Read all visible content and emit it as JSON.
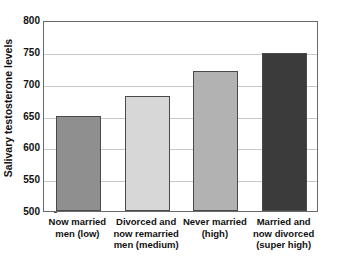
{
  "chart_data": {
    "type": "bar",
    "title": "",
    "xlabel": "",
    "ylabel": "Salivary testosterone levels",
    "ylim": [
      500,
      800
    ],
    "yticks": [
      500,
      550,
      600,
      650,
      700,
      750,
      800
    ],
    "ytick_labels": [
      "500",
      "550",
      "600",
      "650",
      "700",
      "750",
      "800"
    ],
    "grid": true,
    "legend": "none",
    "categories": [
      "Now married men (low)",
      "Divorced and now remarried men (medium)",
      "Never married (high)",
      "Married and now divorced (super high)"
    ],
    "category_lines": [
      [
        "Now married",
        "men (low)"
      ],
      [
        "Divorced and",
        "now remarried",
        "men (medium)"
      ],
      [
        "Never married",
        "(high)"
      ],
      [
        "Married and",
        "now divorced",
        "(super high)"
      ]
    ],
    "values": [
      650,
      680,
      720,
      748
    ],
    "bar_colors": [
      "#8f8f8f",
      "#d7d7d7",
      "#b2b2b2",
      "#3b3b3b"
    ],
    "bar_border_color": "#4a4a4a"
  },
  "axes": {
    "frame_color": "#6a6a6a",
    "gridline_color": "#c9c9c9",
    "text_color": "#111111"
  }
}
